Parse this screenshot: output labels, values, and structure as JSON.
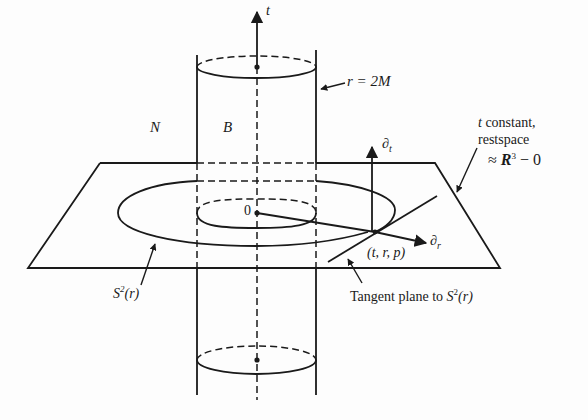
{
  "diagram": {
    "type": "spacetime-embedding",
    "labels": {
      "t_axis": "t",
      "schwarzschild_radius": "r = 2M",
      "region_N": "N",
      "region_B": "B",
      "origin": "0",
      "partial_t": "∂",
      "partial_t_sub": "t",
      "partial_r": "∂",
      "partial_r_sub": "r",
      "point": "(t, r, p)",
      "restspace_line1": "t constant,",
      "restspace_line2": "restspace",
      "restspace_line3_prefix": "≈ ",
      "restspace_R": "R",
      "restspace_R_sup": "3",
      "restspace_line3_suffix": " − 0",
      "sphere_S": "S",
      "sphere_sup": "2",
      "sphere_arg": "(r)",
      "tangent_plane_prefix": "Tangent plane to ",
      "tangent_S": "S",
      "tangent_sup": "2",
      "tangent_arg": "(r)"
    },
    "colors": {
      "ink": "#1a1a1a",
      "paper": "#fdfdfd"
    }
  }
}
